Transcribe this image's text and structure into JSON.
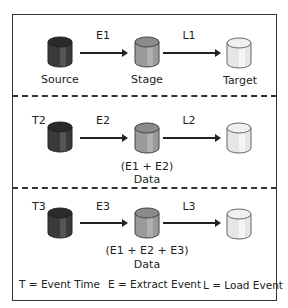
{
  "diagram": {
    "rows": [
      {
        "time_label": "",
        "extract_label": "E1",
        "load_label": "L1",
        "source_label": "Source",
        "stage_label_1": "Stage",
        "stage_label_2": "",
        "target_label": "Target"
      },
      {
        "time_label": "T2",
        "extract_label": "E2",
        "load_label": "L2",
        "source_label": "",
        "stage_label_1": "(E1 + E2)",
        "stage_label_2": "Data",
        "target_label": ""
      },
      {
        "time_label": "T3",
        "extract_label": "E3",
        "load_label": "L3",
        "source_label": "",
        "stage_label_1": "(E1 + E2 + E3)",
        "stage_label_2": "Data",
        "target_label": ""
      }
    ],
    "legend": {
      "time": "T = Event Time",
      "extract": "E = Extract Event",
      "load": "L = Load Event"
    },
    "colors": {
      "source_db": "#3a3a3a",
      "stage_db": "#9a9a9a",
      "target_db": "#e6e6e6",
      "border": "#333333"
    }
  }
}
